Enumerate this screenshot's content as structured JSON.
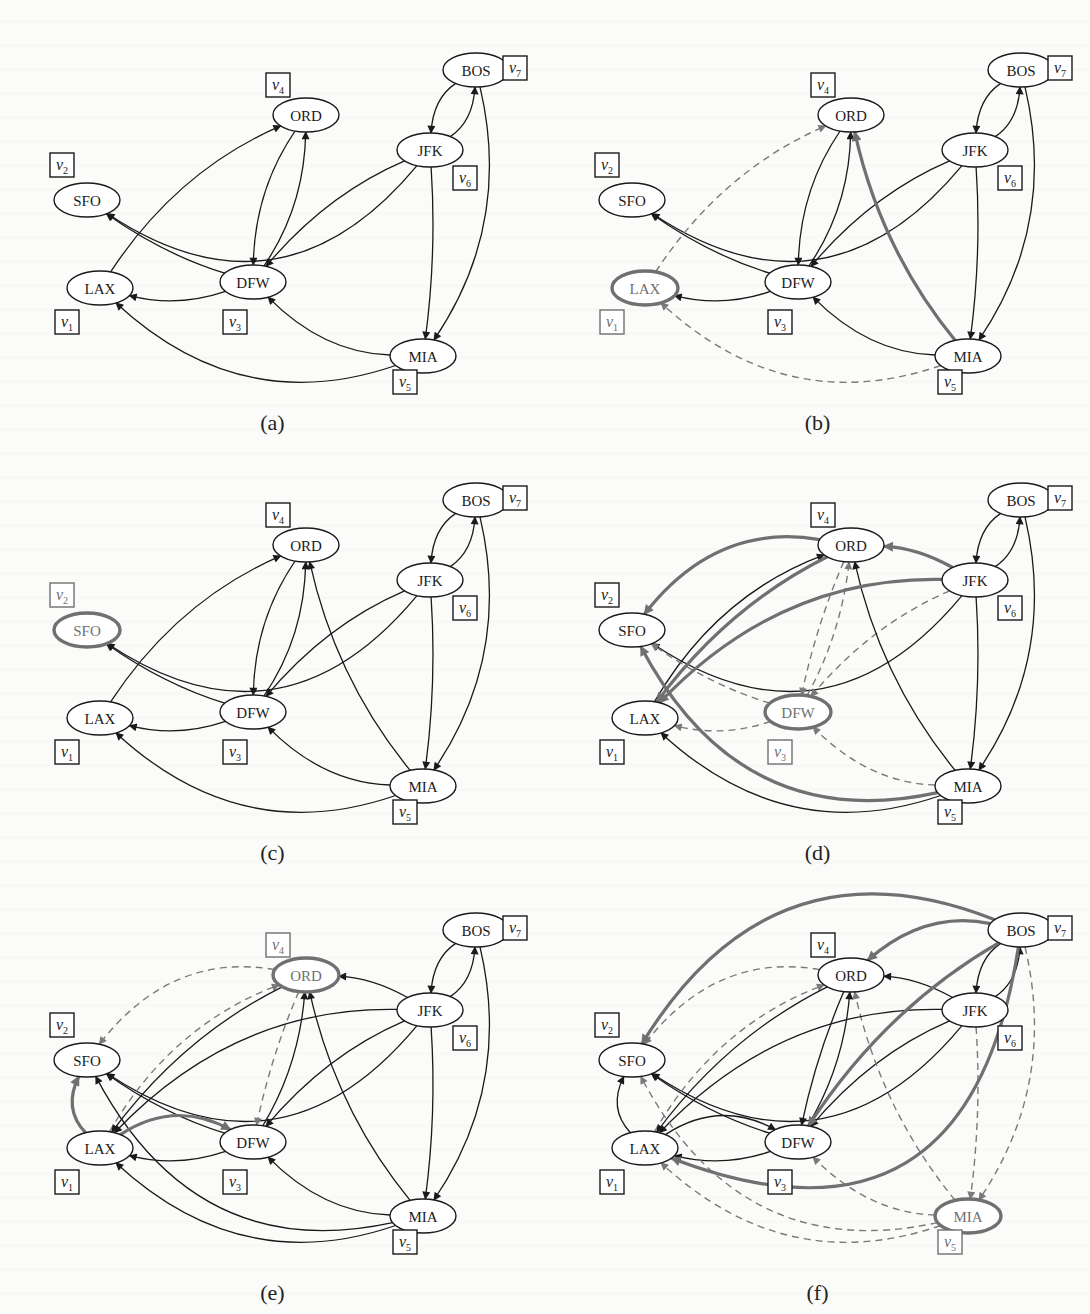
{
  "figure": {
    "nodes": [
      {
        "id": "LAX",
        "vertex": "v1",
        "sub": "1",
        "x": 100,
        "y": 288,
        "lx": 67,
        "ly": 322
      },
      {
        "id": "SFO",
        "vertex": "v2",
        "sub": "2",
        "x": 87,
        "y": 200,
        "lx": 62,
        "ly": 165
      },
      {
        "id": "DFW",
        "vertex": "v3",
        "sub": "3",
        "x": 253,
        "y": 282,
        "lx": 235,
        "ly": 322
      },
      {
        "id": "ORD",
        "vertex": "v4",
        "sub": "4",
        "x": 306,
        "y": 115,
        "lx": 278,
        "ly": 85
      },
      {
        "id": "MIA",
        "vertex": "v5",
        "sub": "5",
        "x": 423,
        "y": 356,
        "lx": 405,
        "ly": 382
      },
      {
        "id": "JFK",
        "vertex": "v6",
        "sub": "6",
        "x": 430,
        "y": 150,
        "lx": 465,
        "ly": 178
      },
      {
        "id": "BOS",
        "vertex": "v7",
        "sub": "7",
        "x": 476,
        "y": 70,
        "lx": 515,
        "ly": 68
      }
    ],
    "colors": {
      "edge": "#1a1a1a",
      "highlight": "#707070",
      "dashed": "#7a7a7a",
      "node_fill": "#ffffff",
      "text": "#1a1a1a"
    },
    "panels": [
      {
        "id": "a",
        "caption": "(a)",
        "x": 0,
        "y": 0,
        "highlight": null,
        "edges": [
          {
            "from": "JFK",
            "to": "SFO",
            "style": "solid",
            "bend": -0.45
          },
          {
            "from": "BOS",
            "to": "JFK",
            "style": "solid",
            "bend": 0.25
          },
          {
            "from": "JFK",
            "to": "BOS",
            "style": "solid",
            "bend": 0.25
          },
          {
            "from": "BOS",
            "to": "MIA",
            "style": "solid",
            "bend": -0.22
          },
          {
            "from": "JFK",
            "to": "MIA",
            "style": "solid",
            "bend": -0.05
          },
          {
            "from": "JFK",
            "to": "DFW",
            "style": "solid",
            "bend": 0.12
          },
          {
            "from": "ORD",
            "to": "DFW",
            "style": "solid",
            "bend": 0.15
          },
          {
            "from": "DFW",
            "to": "ORD",
            "style": "solid",
            "bend": 0.15
          },
          {
            "from": "LAX",
            "to": "ORD",
            "style": "solid",
            "bend": -0.15
          },
          {
            "from": "DFW",
            "to": "SFO",
            "style": "solid",
            "bend": -0.08
          },
          {
            "from": "DFW",
            "to": "LAX",
            "style": "solid",
            "bend": -0.15
          },
          {
            "from": "MIA",
            "to": "DFW",
            "style": "solid",
            "bend": -0.2
          },
          {
            "from": "MIA",
            "to": "LAX",
            "style": "solid",
            "bend": -0.3
          }
        ]
      },
      {
        "id": "b",
        "caption": "(b)",
        "x": 545,
        "y": 0,
        "highlight": "LAX",
        "edges": [
          {
            "from": "JFK",
            "to": "SFO",
            "style": "solid",
            "bend": -0.45
          },
          {
            "from": "BOS",
            "to": "JFK",
            "style": "solid",
            "bend": 0.25
          },
          {
            "from": "JFK",
            "to": "BOS",
            "style": "solid",
            "bend": 0.25
          },
          {
            "from": "BOS",
            "to": "MIA",
            "style": "solid",
            "bend": -0.22
          },
          {
            "from": "JFK",
            "to": "MIA",
            "style": "solid",
            "bend": -0.05
          },
          {
            "from": "JFK",
            "to": "DFW",
            "style": "solid",
            "bend": 0.12
          },
          {
            "from": "ORD",
            "to": "DFW",
            "style": "solid",
            "bend": 0.15
          },
          {
            "from": "DFW",
            "to": "ORD",
            "style": "solid",
            "bend": 0.15
          },
          {
            "from": "LAX",
            "to": "ORD",
            "style": "dashed",
            "bend": -0.15
          },
          {
            "from": "DFW",
            "to": "SFO",
            "style": "solid",
            "bend": -0.08
          },
          {
            "from": "DFW",
            "to": "LAX",
            "style": "solid",
            "bend": -0.15
          },
          {
            "from": "MIA",
            "to": "DFW",
            "style": "solid",
            "bend": -0.2
          },
          {
            "from": "MIA",
            "to": "LAX",
            "style": "dashed",
            "bend": -0.3
          },
          {
            "from": "MIA",
            "to": "ORD",
            "style": "new",
            "bend": -0.12
          }
        ]
      },
      {
        "id": "c",
        "caption": "(c)",
        "x": 0,
        "y": 430,
        "highlight": "SFO",
        "edges": [
          {
            "from": "JFK",
            "to": "SFO",
            "style": "solid",
            "bend": -0.45
          },
          {
            "from": "BOS",
            "to": "JFK",
            "style": "solid",
            "bend": 0.25
          },
          {
            "from": "JFK",
            "to": "BOS",
            "style": "solid",
            "bend": 0.25
          },
          {
            "from": "BOS",
            "to": "MIA",
            "style": "solid",
            "bend": -0.22
          },
          {
            "from": "JFK",
            "to": "MIA",
            "style": "solid",
            "bend": -0.05
          },
          {
            "from": "JFK",
            "to": "DFW",
            "style": "solid",
            "bend": 0.12
          },
          {
            "from": "ORD",
            "to": "DFW",
            "style": "solid",
            "bend": 0.15
          },
          {
            "from": "DFW",
            "to": "ORD",
            "style": "solid",
            "bend": 0.15
          },
          {
            "from": "LAX",
            "to": "ORD",
            "style": "solid",
            "bend": -0.15
          },
          {
            "from": "DFW",
            "to": "SFO",
            "style": "solid",
            "bend": -0.08
          },
          {
            "from": "DFW",
            "to": "LAX",
            "style": "solid",
            "bend": -0.15
          },
          {
            "from": "MIA",
            "to": "DFW",
            "style": "solid",
            "bend": -0.2
          },
          {
            "from": "MIA",
            "to": "LAX",
            "style": "solid",
            "bend": -0.3
          },
          {
            "from": "MIA",
            "to": "ORD",
            "style": "solid",
            "bend": -0.12
          }
        ]
      },
      {
        "id": "d",
        "caption": "(d)",
        "x": 545,
        "y": 430,
        "highlight": "DFW",
        "edges": [
          {
            "from": "JFK",
            "to": "SFO",
            "style": "solid",
            "bend": -0.45
          },
          {
            "from": "BOS",
            "to": "JFK",
            "style": "solid",
            "bend": 0.25
          },
          {
            "from": "JFK",
            "to": "BOS",
            "style": "solid",
            "bend": 0.25
          },
          {
            "from": "BOS",
            "to": "MIA",
            "style": "solid",
            "bend": -0.22
          },
          {
            "from": "JFK",
            "to": "MIA",
            "style": "solid",
            "bend": -0.05
          },
          {
            "from": "JFK",
            "to": "DFW",
            "style": "dashed",
            "bend": 0.12
          },
          {
            "from": "ORD",
            "to": "DFW",
            "style": "dashed",
            "bend": 0.05
          },
          {
            "from": "DFW",
            "to": "ORD",
            "style": "dashed",
            "bend": 0.1
          },
          {
            "from": "LAX",
            "to": "ORD",
            "style": "solid",
            "bend": -0.18
          },
          {
            "from": "DFW",
            "to": "SFO",
            "style": "dashed",
            "bend": -0.08
          },
          {
            "from": "DFW",
            "to": "LAX",
            "style": "dashed",
            "bend": -0.15
          },
          {
            "from": "MIA",
            "to": "DFW",
            "style": "dashed",
            "bend": -0.2
          },
          {
            "from": "MIA",
            "to": "LAX",
            "style": "solid",
            "bend": -0.3
          },
          {
            "from": "MIA",
            "to": "ORD",
            "style": "solid",
            "bend": -0.12
          },
          {
            "from": "ORD",
            "to": "SFO",
            "style": "new",
            "bend": 0.3
          },
          {
            "from": "ORD",
            "to": "LAX",
            "style": "new",
            "bend": 0.12
          },
          {
            "from": "JFK",
            "to": "ORD",
            "style": "new",
            "bend": 0.12
          },
          {
            "from": "JFK",
            "to": "LAX",
            "style": "new",
            "bend": 0.22
          },
          {
            "from": "MIA",
            "to": "SFO",
            "style": "new",
            "bend": -0.38
          }
        ]
      },
      {
        "id": "e",
        "caption": "(e)",
        "x": 0,
        "y": 860,
        "highlight": "ORD",
        "edges": [
          {
            "from": "JFK",
            "to": "SFO",
            "style": "solid",
            "bend": -0.45
          },
          {
            "from": "BOS",
            "to": "JFK",
            "style": "solid",
            "bend": 0.25
          },
          {
            "from": "JFK",
            "to": "BOS",
            "style": "solid",
            "bend": 0.25
          },
          {
            "from": "BOS",
            "to": "MIA",
            "style": "solid",
            "bend": -0.22
          },
          {
            "from": "JFK",
            "to": "MIA",
            "style": "solid",
            "bend": -0.05
          },
          {
            "from": "JFK",
            "to": "DFW",
            "style": "solid",
            "bend": 0.12
          },
          {
            "from": "ORD",
            "to": "DFW",
            "style": "dashed",
            "bend": 0.05
          },
          {
            "from": "DFW",
            "to": "ORD",
            "style": "solid",
            "bend": 0.12
          },
          {
            "from": "LAX",
            "to": "ORD",
            "style": "dashed",
            "bend": -0.18
          },
          {
            "from": "DFW",
            "to": "SFO",
            "style": "solid",
            "bend": -0.08
          },
          {
            "from": "DFW",
            "to": "LAX",
            "style": "solid",
            "bend": -0.15
          },
          {
            "from": "MIA",
            "to": "DFW",
            "style": "solid",
            "bend": -0.2
          },
          {
            "from": "MIA",
            "to": "LAX",
            "style": "solid",
            "bend": -0.3
          },
          {
            "from": "MIA",
            "to": "ORD",
            "style": "solid",
            "bend": -0.12
          },
          {
            "from": "ORD",
            "to": "SFO",
            "style": "dashed",
            "bend": 0.3
          },
          {
            "from": "ORD",
            "to": "LAX",
            "style": "solid",
            "bend": 0.12
          },
          {
            "from": "JFK",
            "to": "ORD",
            "style": "solid",
            "bend": 0.12
          },
          {
            "from": "JFK",
            "to": "LAX",
            "style": "solid",
            "bend": 0.22
          },
          {
            "from": "MIA",
            "to": "SFO",
            "style": "solid",
            "bend": -0.38
          },
          {
            "from": "LAX",
            "to": "SFO",
            "style": "new",
            "bend": -0.35
          },
          {
            "from": "LAX",
            "to": "DFW",
            "style": "new",
            "bend": -0.3
          }
        ]
      },
      {
        "id": "f",
        "caption": "(f)",
        "x": 545,
        "y": 860,
        "highlight": "MIA",
        "edges": [
          {
            "from": "JFK",
            "to": "SFO",
            "style": "solid",
            "bend": -0.45
          },
          {
            "from": "BOS",
            "to": "JFK",
            "style": "solid",
            "bend": 0.25
          },
          {
            "from": "JFK",
            "to": "BOS",
            "style": "solid",
            "bend": 0.25
          },
          {
            "from": "BOS",
            "to": "MIA",
            "style": "dashed",
            "bend": -0.22
          },
          {
            "from": "JFK",
            "to": "MIA",
            "style": "dashed",
            "bend": -0.05
          },
          {
            "from": "JFK",
            "to": "DFW",
            "style": "solid",
            "bend": 0.12
          },
          {
            "from": "ORD",
            "to": "DFW",
            "style": "solid",
            "bend": 0.05
          },
          {
            "from": "DFW",
            "to": "ORD",
            "style": "solid",
            "bend": 0.12
          },
          {
            "from": "LAX",
            "to": "ORD",
            "style": "dashed",
            "bend": -0.18
          },
          {
            "from": "DFW",
            "to": "SFO",
            "style": "solid",
            "bend": -0.08
          },
          {
            "from": "DFW",
            "to": "LAX",
            "style": "solid",
            "bend": -0.15
          },
          {
            "from": "MIA",
            "to": "DFW",
            "style": "dashed",
            "bend": -0.2
          },
          {
            "from": "MIA",
            "to": "LAX",
            "style": "dashed",
            "bend": -0.3
          },
          {
            "from": "MIA",
            "to": "ORD",
            "style": "dashed",
            "bend": -0.12
          },
          {
            "from": "ORD",
            "to": "SFO",
            "style": "dashed",
            "bend": 0.3
          },
          {
            "from": "ORD",
            "to": "LAX",
            "style": "solid",
            "bend": 0.12
          },
          {
            "from": "JFK",
            "to": "ORD",
            "style": "solid",
            "bend": 0.12
          },
          {
            "from": "JFK",
            "to": "LAX",
            "style": "solid",
            "bend": 0.22
          },
          {
            "from": "MIA",
            "to": "SFO",
            "style": "dashed",
            "bend": -0.38
          },
          {
            "from": "LAX",
            "to": "SFO",
            "style": "solid",
            "bend": -0.35
          },
          {
            "from": "LAX",
            "to": "DFW",
            "style": "solid",
            "bend": -0.3
          },
          {
            "from": "BOS",
            "to": "SFO",
            "style": "new",
            "bend": 0.42
          },
          {
            "from": "BOS",
            "to": "ORD",
            "style": "new",
            "bend": 0.25
          },
          {
            "from": "BOS",
            "to": "DFW",
            "style": "new",
            "bend": 0.12
          },
          {
            "from": "BOS",
            "to": "LAX",
            "style": "new",
            "bend": -0.62
          }
        ]
      }
    ]
  }
}
